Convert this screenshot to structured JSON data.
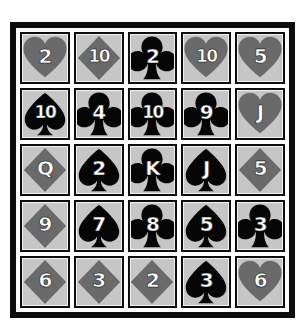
{
  "board": {
    "title": "Playing Card Grid",
    "rows": 5,
    "columns": 5,
    "frame_color": "#0d0d0d",
    "card_face_color": "#c6c6c6",
    "page_background": "#ffffff"
  },
  "suits": {
    "hearts": {
      "symbol": "heart",
      "color": "#6a6a6a"
    },
    "diamonds": {
      "symbol": "diamond",
      "color": "#6a6a6a"
    },
    "clubs": {
      "symbol": "club",
      "color": "#050505"
    },
    "spades": {
      "symbol": "spade",
      "color": "#050505"
    }
  },
  "cards": [
    {
      "rank": "2",
      "suit": "hearts"
    },
    {
      "rank": "10",
      "suit": "diamonds"
    },
    {
      "rank": "2",
      "suit": "clubs"
    },
    {
      "rank": "10",
      "suit": "hearts"
    },
    {
      "rank": "5",
      "suit": "hearts"
    },
    {
      "rank": "10",
      "suit": "spades"
    },
    {
      "rank": "4",
      "suit": "clubs"
    },
    {
      "rank": "10",
      "suit": "clubs"
    },
    {
      "rank": "9",
      "suit": "clubs"
    },
    {
      "rank": "J",
      "suit": "hearts"
    },
    {
      "rank": "Q",
      "suit": "diamonds"
    },
    {
      "rank": "2",
      "suit": "spades"
    },
    {
      "rank": "K",
      "suit": "clubs"
    },
    {
      "rank": "J",
      "suit": "spades"
    },
    {
      "rank": "5",
      "suit": "diamonds"
    },
    {
      "rank": "9",
      "suit": "diamonds"
    },
    {
      "rank": "7",
      "suit": "spades"
    },
    {
      "rank": "8",
      "suit": "clubs"
    },
    {
      "rank": "5",
      "suit": "spades"
    },
    {
      "rank": "3",
      "suit": "clubs"
    },
    {
      "rank": "6",
      "suit": "diamonds"
    },
    {
      "rank": "3",
      "suit": "diamonds"
    },
    {
      "rank": "2",
      "suit": "diamonds"
    },
    {
      "rank": "3",
      "suit": "spades"
    },
    {
      "rank": "6",
      "suit": "hearts"
    }
  ]
}
